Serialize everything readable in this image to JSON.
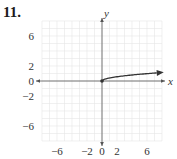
{
  "problem": {
    "number": "11."
  },
  "chart_data": {
    "type": "line",
    "title": "",
    "xlabel": "x",
    "ylabel": "y",
    "xlim": [
      -8,
      8
    ],
    "ylim": [
      -8,
      8
    ],
    "grid": true,
    "x_ticks": [
      -6,
      -2,
      0,
      2,
      6
    ],
    "y_ticks": [
      6,
      2,
      0,
      -2,
      -6
    ],
    "x_tick_labels": [
      "−6",
      "−2",
      "0",
      "2",
      "6"
    ],
    "y_tick_labels": [
      "6",
      "2",
      "0",
      "−2",
      "−6"
    ],
    "series": [
      {
        "name": "curve",
        "description": "square-root-shaped curve starting at origin, arrow pointing right",
        "start_point": [
          0,
          0
        ],
        "x": [
          0,
          0.5,
          1,
          2,
          3,
          4,
          5,
          6,
          7,
          8
        ],
        "values": [
          0,
          0.28,
          0.4,
          0.57,
          0.69,
          0.8,
          0.89,
          0.98,
          1.06,
          1.13
        ],
        "end_arrow": true
      }
    ],
    "colors": {
      "grid": "#e6e6e6",
      "axis": "#555555",
      "curve": "#333333"
    }
  }
}
